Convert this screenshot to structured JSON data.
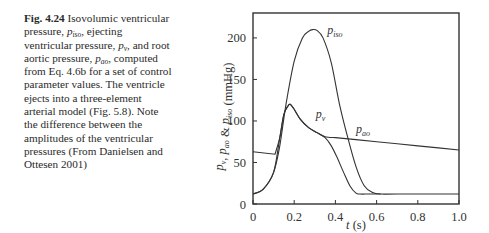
{
  "caption": {
    "fig_label": "Fig. 4.24",
    "segments": [
      {
        "t": " Isovolumic ventricular pressure, "
      },
      {
        "v": "p",
        "s": "iso"
      },
      {
        "t": ", ejecting ventricular pressure, "
      },
      {
        "v": "p",
        "s": "v"
      },
      {
        "t": ", and root aortic pressure, "
      },
      {
        "v": "p",
        "s": "ao"
      },
      {
        "t": ", computed from Eq. 4.6b for a set of control parameter values. The ventricle ejects into a three-element arterial model (Fig. 5.8). Note the difference between the amplitudes of the ventricular pressures (From Danielsen and Ottesen 2001)"
      }
    ]
  },
  "chart_data": {
    "type": "line",
    "title": "",
    "xlabel": "t (s)",
    "ylabel": "p_v, p_ao & p_iso (mmHg)",
    "xlim": [
      0,
      1.0
    ],
    "ylim": [
      0,
      230
    ],
    "xticks": [
      0,
      0.2,
      0.4,
      0.6,
      0.8,
      1.0
    ],
    "xtick_labels": [
      "0",
      "0.2",
      "0.4",
      "0.6",
      "0.8",
      "1.0"
    ],
    "yticks": [
      0,
      50,
      100,
      150,
      200
    ],
    "ytick_labels": [
      "0",
      "50",
      "100",
      "150",
      "200"
    ],
    "grid": false,
    "legend": "inline labels",
    "series": [
      {
        "name": "p_iso",
        "label_text": "p",
        "label_sub": "iso",
        "label_pos": [
          0.36,
          205
        ],
        "x": [
          0,
          0.05,
          0.1,
          0.13,
          0.16,
          0.2,
          0.24,
          0.27,
          0.29,
          0.31,
          0.34,
          0.38,
          0.42,
          0.46,
          0.5,
          0.54,
          0.58,
          0.62,
          0.7,
          1.0
        ],
        "values": [
          12,
          18,
          38,
          70,
          120,
          172,
          200,
          208,
          210,
          209,
          200,
          170,
          120,
          80,
          45,
          22,
          14,
          12,
          12,
          12
        ]
      },
      {
        "name": "p_v",
        "label_text": "p",
        "label_sub": "v",
        "label_pos": [
          0.305,
          104
        ],
        "x": [
          0,
          0.05,
          0.1,
          0.13,
          0.15,
          0.17,
          0.18,
          0.2,
          0.23,
          0.27,
          0.31,
          0.35,
          0.38,
          0.41,
          0.44,
          0.47,
          0.5,
          0.52,
          0.56,
          0.6,
          0.62
        ],
        "values": [
          12,
          18,
          38,
          80,
          108,
          118,
          120,
          114,
          102,
          92,
          86,
          80,
          70,
          55,
          38,
          22,
          13,
          12,
          12,
          12,
          12
        ]
      },
      {
        "name": "p_ao",
        "label_text": "p",
        "label_sub": "ao",
        "label_pos": [
          0.5,
          86
        ],
        "x": [
          0,
          0.107,
          0.13,
          0.15,
          0.17,
          0.18,
          0.2,
          0.23,
          0.27,
          0.31,
          0.35,
          0.4,
          0.5,
          0.6,
          0.7,
          0.8,
          0.9,
          1.0
        ],
        "values": [
          63,
          60,
          80,
          108,
          118,
          120,
          114,
          102,
          92,
          86,
          81,
          80,
          77.5,
          75,
          72.5,
          70,
          67.5,
          65
        ]
      }
    ]
  }
}
